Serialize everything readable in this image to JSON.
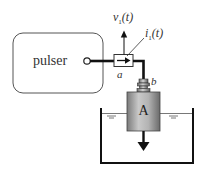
{
  "diagram": {
    "pulser": {
      "label": "pulser"
    },
    "sensor": {
      "voltage_label_main": "v",
      "voltage_label_sub": "1",
      "voltage_label_arg": "(t)",
      "current_label_main": "i",
      "current_label_sub": "1",
      "current_label_arg": "(t)"
    },
    "nodes": {
      "a": "a",
      "b": "b"
    },
    "transducer": {
      "label": "A"
    },
    "colors": {
      "line": "#111111",
      "box_stroke": "#444444",
      "body_light": "#c8c8c8",
      "body_dark": "#6e6e6e"
    }
  }
}
